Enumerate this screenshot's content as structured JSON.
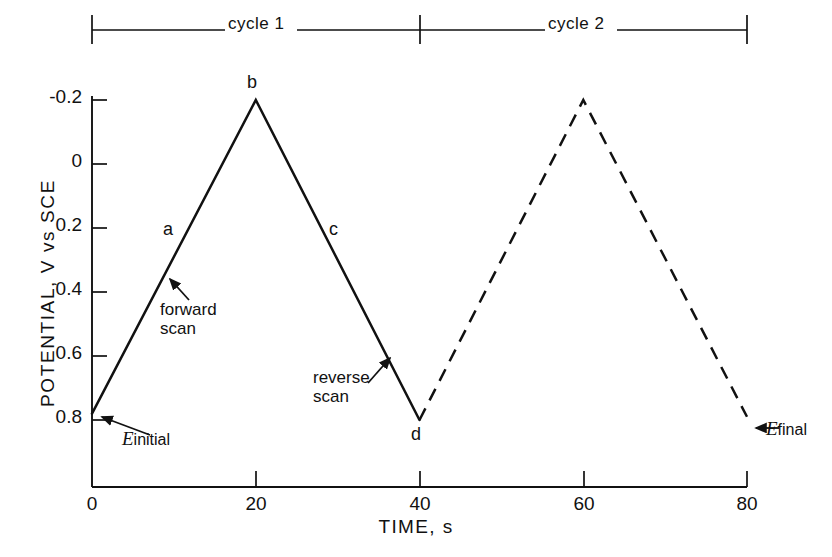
{
  "figure": {
    "kind": "cyclic-voltammetry-potential-waveform",
    "background_color": "#ffffff",
    "ink_color": "#111111"
  },
  "brackets": [
    {
      "name": "cycle-1",
      "label": "cycle 1",
      "t_start": 0,
      "t_end": 40
    },
    {
      "name": "cycle-2",
      "label": "cycle 2",
      "t_start": 40,
      "t_end": 80
    }
  ],
  "annotations": {
    "segment_a": "a",
    "segment_b": "b",
    "segment_c": "c",
    "segment_d": "d",
    "forward_scan_line1": "forward",
    "forward_scan_line2": "scan",
    "reverse_scan_line1": "reverse",
    "reverse_scan_line2": "scan",
    "e_initial_symbol": "E",
    "e_initial_subscript": "initial",
    "e_final_symbol": "E",
    "e_final_subscript": "final"
  },
  "chart_data": {
    "type": "line",
    "title": "",
    "xlabel": "TIME, s",
    "ylabel": "POTENTIAL, V vs SCE",
    "xlim": [
      0,
      80
    ],
    "ylim": [
      -0.2,
      0.85
    ],
    "y_inverted": true,
    "grid": false,
    "legend": null,
    "xticks": [
      0,
      20,
      40,
      60,
      80
    ],
    "xtick_labels": [
      "0",
      "20",
      "40",
      "60",
      "80"
    ],
    "yticks": [
      -0.2,
      0,
      0.2,
      0.4,
      0.6,
      0.8
    ],
    "ytick_labels": [
      "-0.2",
      "0",
      "0.2",
      "0.4",
      "0.6",
      "0.8"
    ],
    "series": [
      {
        "name": "cycle 1",
        "style": "solid",
        "color": "#111111",
        "x": [
          0,
          20,
          40
        ],
        "y": [
          0.78,
          -0.2,
          0.8
        ]
      },
      {
        "name": "cycle 2",
        "style": "dashed",
        "color": "#111111",
        "x": [
          40,
          60,
          80
        ],
        "y": [
          0.8,
          -0.2,
          0.79
        ]
      }
    ],
    "points": [
      {
        "label": "a",
        "description": "forward scan of cycle 1",
        "t": 10,
        "v": 0.29
      },
      {
        "label": "b",
        "description": "switching potential, anodic vertex",
        "t": 20,
        "v": -0.2
      },
      {
        "label": "c",
        "description": "reverse scan of cycle 1",
        "t": 30,
        "v": 0.3
      },
      {
        "label": "d",
        "description": "end of cycle 1 / start of cycle 2",
        "t": 40,
        "v": 0.8
      },
      {
        "label": "E initial",
        "description": "initial potential",
        "t": 0,
        "v": 0.78
      },
      {
        "label": "E final",
        "description": "final potential",
        "t": 80,
        "v": 0.79
      }
    ]
  }
}
